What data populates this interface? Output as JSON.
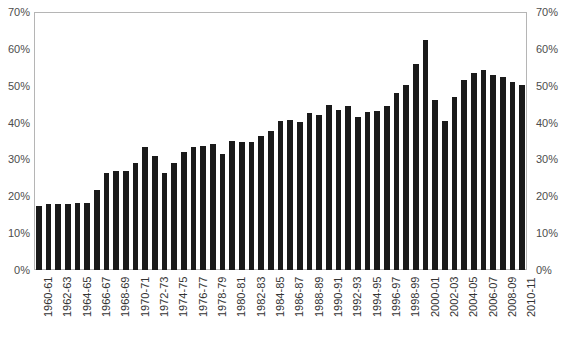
{
  "chart_data": {
    "type": "bar",
    "title": "",
    "subtitle": "",
    "xlabel": "",
    "ylabel": "",
    "ylim": [
      0,
      70
    ],
    "y_tick_labels": [
      "0%",
      "10%",
      "20%",
      "30%",
      "40%",
      "50%",
      "60%",
      "70%"
    ],
    "y_tick_values": [
      0,
      10,
      20,
      30,
      40,
      50,
      60,
      70
    ],
    "grid": false,
    "legend": "none",
    "dual_y_axis": true,
    "bar_color": "#1a1a1a",
    "axis_color": "#b5b5b5",
    "categories": [
      "1960-61",
      "1961-62",
      "1962-63",
      "1963-64",
      "1964-65",
      "1965-66",
      "1966-67",
      "1967-68",
      "1968-69",
      "1969-70",
      "1970-71",
      "1971-72",
      "1972-73",
      "1973-74",
      "1974-75",
      "1975-76",
      "1976-77",
      "1977-78",
      "1978-79",
      "1979-80",
      "1980-81",
      "1981-82",
      "1982-83",
      "1983-84",
      "1984-85",
      "1985-86",
      "1986-87",
      "1987-88",
      "1988-89",
      "1989-90",
      "1990-91",
      "1991-92",
      "1992-93",
      "1993-94",
      "1994-95",
      "1995-96",
      "1996-97",
      "1997-98",
      "1998-99",
      "1999-00",
      "2000-01",
      "2001-02",
      "2002-03",
      "2003-04",
      "2004-05",
      "2005-06",
      "2006-07",
      "2007-08",
      "2008-09",
      "2009-10",
      "2010-11"
    ],
    "values": [
      17.5,
      17.8,
      17.9,
      17.8,
      18.2,
      18.2,
      21.8,
      26.2,
      27.0,
      26.8,
      28.9,
      33.3,
      30.9,
      26.3,
      28.9,
      32.0,
      33.4,
      33.7,
      34.2,
      31.6,
      35.0,
      34.8,
      34.6,
      36.4,
      37.7,
      40.4,
      40.6,
      40.2,
      42.5,
      42.1,
      44.7,
      43.3,
      44.4,
      41.5,
      42.8,
      43.1,
      44.5,
      48.0,
      50.2,
      55.8,
      62.5,
      46.0,
      40.3,
      47.0,
      51.6,
      53.4,
      54.4,
      53.0,
      52.5,
      51.1,
      50.3
    ],
    "x_tick_labels": [
      "1960-61",
      "1962-63",
      "1964-65",
      "1966-67",
      "1968-69",
      "1970-71",
      "1972-73",
      "1974-75",
      "1976-77",
      "1978-79",
      "1980-81",
      "1982-83",
      "1984-85",
      "1986-87",
      "1988-89",
      "1990-91",
      "1992-93",
      "1994-95",
      "1996-97",
      "1998-99",
      "2000-01",
      "2002-03",
      "2004-05",
      "2006-07",
      "2008-09",
      "2010-11"
    ],
    "x_tick_indices": [
      0,
      2,
      4,
      6,
      8,
      10,
      12,
      14,
      16,
      18,
      20,
      22,
      24,
      26,
      28,
      30,
      32,
      34,
      36,
      38,
      40,
      42,
      44,
      46,
      48,
      50
    ]
  },
  "source_note": ""
}
